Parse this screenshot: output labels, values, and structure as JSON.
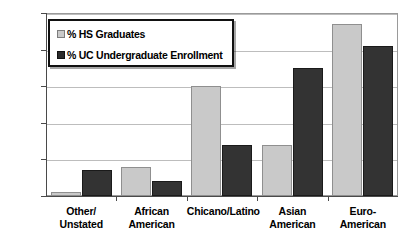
{
  "chart_data": {
    "type": "bar",
    "title": "",
    "xlabel": "",
    "ylabel": "",
    "ylim": [
      0,
      50
    ],
    "yticks": [
      "0%",
      "10%",
      "20%",
      "30%",
      "40%",
      "50%"
    ],
    "ytick_values": [
      0,
      10,
      20,
      30,
      40,
      50
    ],
    "grid": true,
    "legend_position": "upper-left-inside",
    "categories": [
      "Other/ Unstated",
      "African American",
      "Chicano/Latino",
      "Asian American",
      "Euro-American"
    ],
    "category_lines": [
      [
        "Other/",
        "Unstated"
      ],
      [
        "African",
        "American"
      ],
      [
        "Chicano/Latino"
      ],
      [
        "Asian",
        "American"
      ],
      [
        "Euro-American"
      ]
    ],
    "series": [
      {
        "name": "% HS Graduates",
        "color": "#c9c9c9",
        "values": [
          1,
          8,
          30,
          14,
          47
        ]
      },
      {
        "name": "% UC Undergraduate Enrollment",
        "color": "#333333",
        "values": [
          7,
          4,
          14,
          35,
          41
        ]
      }
    ]
  },
  "legend": {
    "items": [
      {
        "label": "% HS Graduates",
        "swatch": "light-gray-square-icon"
      },
      {
        "label": "% UC Undergraduate Enrollment",
        "swatch": "dark-square-icon"
      }
    ]
  }
}
